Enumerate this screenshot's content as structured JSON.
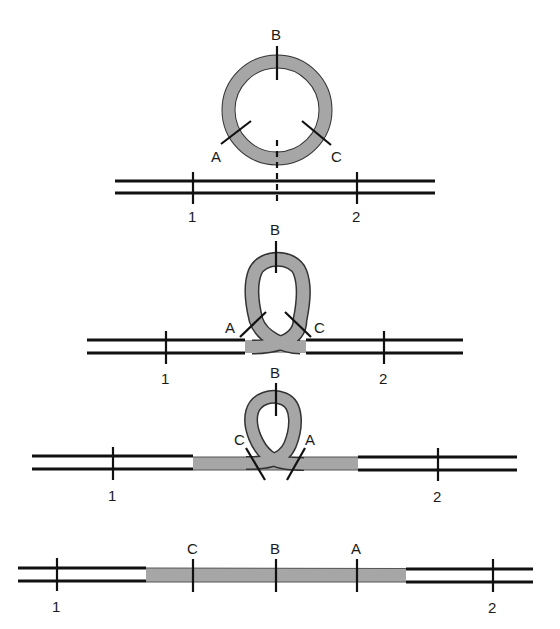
{
  "colors": {
    "background": "#ffffff",
    "line": "#111111",
    "insert": "#a6a6a6",
    "insert_outline": "#333333"
  },
  "panels": [
    {
      "id": "panel-1",
      "description": "Circular element with markers A, B, C above linear duplex with markers 1 and 2",
      "loop_labels": {
        "a": "A",
        "b": "B",
        "c": "C"
      },
      "line_labels": {
        "left": "1",
        "right": "2"
      }
    },
    {
      "id": "panel-2",
      "description": "Circle pinched into loop, crossing at insertion site",
      "loop_labels": {
        "a": "A",
        "b": "B",
        "c": "C"
      },
      "line_labels": {
        "left": "1",
        "right": "2"
      }
    },
    {
      "id": "panel-3",
      "description": "Loop narrowing as element integrates; C and A swap sides",
      "loop_labels": {
        "a": "A",
        "b": "B",
        "c": "C"
      },
      "line_labels": {
        "left": "1",
        "right": "2"
      }
    },
    {
      "id": "panel-4",
      "description": "Linear integrated element with markers C, B, A between 1 and 2",
      "insert_labels": {
        "c": "C",
        "b": "B",
        "a": "A"
      },
      "line_labels": {
        "left": "1",
        "right": "2"
      }
    }
  ]
}
